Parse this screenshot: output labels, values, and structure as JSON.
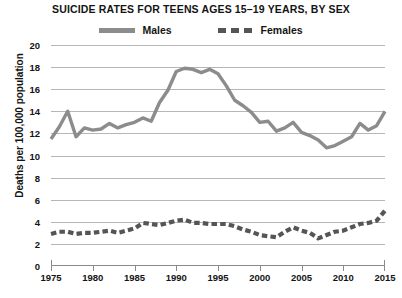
{
  "chart_data": {
    "type": "line",
    "title": "SUICIDE RATES FOR TEENS AGES 15–19 YEARS, BY SEX",
    "xlabel": "",
    "ylabel": "Deaths per 100,000 population",
    "xlim": [
      1975,
      2015
    ],
    "ylim": [
      0,
      20
    ],
    "ytick_labels": [
      "20",
      "18",
      "16",
      "14",
      "12",
      "10",
      "8",
      "6",
      "4",
      "2",
      "0"
    ],
    "ytick_values": [
      20,
      18,
      16,
      14,
      12,
      10,
      8,
      6,
      4,
      2,
      0
    ],
    "xtick_labels": [
      "1975",
      "1980",
      "1985",
      "1990",
      "1995",
      "2000",
      "2005",
      "2010",
      "2015"
    ],
    "xtick_values": [
      1975,
      1980,
      1985,
      1990,
      1995,
      2000,
      2005,
      2010,
      2015
    ],
    "grid": true,
    "legend_position": "top-center",
    "x": [
      1975,
      1976,
      1977,
      1978,
      1979,
      1980,
      1981,
      1982,
      1983,
      1984,
      1985,
      1986,
      1987,
      1988,
      1989,
      1990,
      1991,
      1992,
      1993,
      1994,
      1995,
      1996,
      1997,
      1998,
      1999,
      2000,
      2001,
      2002,
      2003,
      2004,
      2005,
      2006,
      2007,
      2008,
      2009,
      2010,
      2011,
      2012,
      2013,
      2014,
      2015
    ],
    "series": [
      {
        "name": "Males",
        "style": "solid",
        "color": "#8c8c8c",
        "values": [
          11.5,
          12.6,
          14.0,
          11.7,
          12.5,
          12.3,
          12.4,
          12.9,
          12.5,
          12.8,
          13.0,
          13.4,
          13.1,
          14.8,
          15.9,
          17.6,
          17.9,
          17.8,
          17.5,
          17.8,
          17.4,
          16.3,
          15.0,
          14.5,
          13.9,
          13.0,
          13.1,
          12.2,
          12.5,
          13.0,
          12.1,
          11.8,
          11.4,
          10.7,
          10.9,
          11.3,
          11.7,
          12.9,
          12.3,
          12.7,
          14.0
        ]
      },
      {
        "name": "Females",
        "style": "dashed",
        "color": "#555555",
        "values": [
          2.9,
          3.1,
          3.1,
          2.9,
          3.0,
          3.0,
          3.1,
          3.2,
          3.0,
          3.2,
          3.4,
          3.9,
          3.8,
          3.7,
          3.9,
          4.1,
          4.2,
          3.9,
          3.9,
          3.8,
          3.8,
          3.8,
          3.6,
          3.3,
          3.1,
          2.8,
          2.7,
          2.6,
          3.1,
          3.5,
          3.2,
          3.0,
          2.5,
          2.8,
          3.1,
          3.2,
          3.5,
          3.8,
          3.9,
          4.1,
          5.0
        ]
      }
    ]
  }
}
